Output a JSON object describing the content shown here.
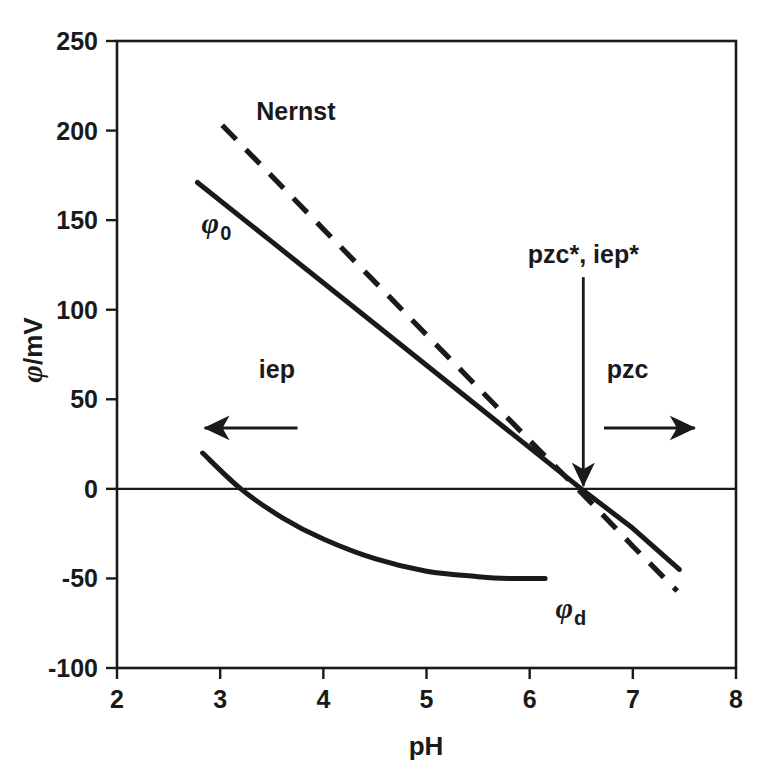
{
  "chart_data": {
    "type": "line",
    "title": "",
    "subtitle": "",
    "xlabel": "pH",
    "ylabel": "φ/mV",
    "xlim": [
      2,
      8
    ],
    "ylim": [
      -100,
      250
    ],
    "xticks": [
      "2",
      "3",
      "4",
      "5",
      "6",
      "7",
      "8"
    ],
    "xtick_values": [
      2,
      3,
      4,
      5,
      6,
      7,
      8
    ],
    "yticks": [
      "250",
      "200",
      "150",
      "100",
      "50",
      "0",
      "-50",
      "-100"
    ],
    "ytick_values": [
      250,
      200,
      150,
      100,
      50,
      0,
      -50,
      -100
    ],
    "grid": false,
    "legend_position": "inline-labels",
    "zero_line": true,
    "series": [
      {
        "name": "Nernst",
        "label": "Nernst",
        "style": "dashed",
        "color": "#1a1a1a",
        "x": [
          3.02,
          4.0,
          5.0,
          6.0,
          6.55,
          7.0,
          7.43
        ],
        "y": [
          203,
          145,
          86,
          27,
          -5,
          -32,
          -57
        ]
      },
      {
        "name": "phi_0",
        "label": "φ",
        "label_sub": "0",
        "style": "solid",
        "color": "#1a1a1a",
        "x": [
          2.78,
          3.5,
          4.5,
          5.5,
          6.5,
          7.0,
          7.45
        ],
        "y": [
          171,
          138,
          92,
          46,
          0,
          -22,
          -45
        ]
      },
      {
        "name": "phi_d",
        "label": "φ",
        "label_sub": "d",
        "style": "solid-curve",
        "color": "#1a1a1a",
        "x": [
          2.83,
          3.2,
          3.6,
          4.0,
          4.5,
          5.0,
          5.5,
          5.8,
          6.15
        ],
        "y": [
          20,
          0,
          -16,
          -28,
          -39,
          -46,
          -49,
          -50,
          -50
        ]
      }
    ],
    "annotations": [
      {
        "name": "pzc-iep-star",
        "text": "pzc*, iep*",
        "x": 6.52,
        "y": 126,
        "arrow": "down",
        "arrow_to_x": 6.52,
        "arrow_to_y": 0
      },
      {
        "name": "iep",
        "text": "iep",
        "x": 3.55,
        "y": 62,
        "arrow": "left",
        "arrow_from_x": 3.75,
        "arrow_from_y": 34,
        "arrow_to_x": 2.85,
        "arrow_to_y": 34
      },
      {
        "name": "pzc",
        "text": "pzc",
        "x": 6.95,
        "y": 62,
        "arrow": "right",
        "arrow_from_x": 6.72,
        "arrow_from_y": 34,
        "arrow_to_x": 7.6,
        "arrow_to_y": 34
      }
    ]
  },
  "labels": {
    "x_axis_title": "pH",
    "y_axis_title_symbol": "φ",
    "y_axis_title_rest": "/mV",
    "nernst": "Nernst",
    "phi_symbol": "φ",
    "phi0_sub": "0",
    "phid_sub": "d",
    "pzc_iep_star": "pzc*, iep*",
    "iep": "iep",
    "pzc": "pzc"
  },
  "colors": {
    "line": "#1a1a1a",
    "axis": "#1a1a1a",
    "background": "#ffffff",
    "text": "#1a1a1a"
  }
}
